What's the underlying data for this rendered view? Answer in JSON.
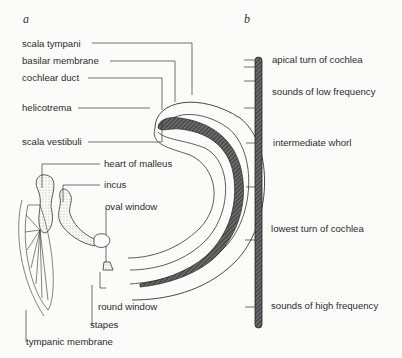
{
  "panels": {
    "a": {
      "letter": "a"
    },
    "b": {
      "letter": "b"
    }
  },
  "panel_a_labels": {
    "scala_tympani": "scala tympani",
    "basilar_membrane": "basilar membrane",
    "cochlear_duct": "cochlear duct",
    "helicotrema": "helicotrema",
    "scala_vestibuli": "scala vestibuli",
    "heart_of_malleus": "heart of malleus",
    "incus": "incus",
    "oval_window": "oval window",
    "round_window": "round window",
    "stapes": "stapes",
    "tympanic_membrane": "tympanic membrane"
  },
  "panel_b_labels": {
    "apical_turn": "apical turn of cochlea",
    "low_frequency": "sounds of low frequency",
    "intermediate_whorl": "intermediate whorl",
    "lowest_turn": "lowest turn of cochlea",
    "high_frequency": "sounds of high frequency"
  },
  "colors": {
    "ink": "#2b2b2b",
    "membrane_fill": "#555555",
    "background": "#fbfbfa"
  }
}
